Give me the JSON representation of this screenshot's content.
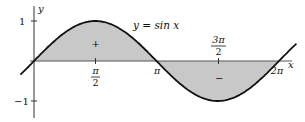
{
  "chart_data": {
    "type": "area",
    "title": "y = sin x",
    "function": "sin",
    "xlabel": "x",
    "ylabel": "y",
    "x_range": [
      -0.08,
      2.12
    ],
    "y_range": [
      -1.25,
      1.25
    ],
    "x_ticks": [
      {
        "value": 1.5708,
        "label_num": "π",
        "label_den": "2"
      },
      {
        "value": 3.1416,
        "label": "π"
      },
      {
        "value": 4.7124,
        "label_num": "3π",
        "label_den": "2"
      },
      {
        "value": 6.2832,
        "label": "2π"
      }
    ],
    "y_ticks": [
      {
        "value": 1,
        "label": "1"
      },
      {
        "value": -1,
        "label": "−1"
      }
    ],
    "regions": [
      {
        "from": 0,
        "to": 3.1416,
        "sign": "+",
        "label": "+"
      },
      {
        "from": 3.1416,
        "to": 6.2832,
        "sign": "-",
        "label": "−"
      }
    ],
    "fill_color": "#c8c8c8",
    "curve_color": "#111111"
  },
  "labels": {
    "equation": "y = sin x",
    "y_axis": "y",
    "x_axis": "x",
    "one": "1",
    "minus_one": "−1",
    "pi_over_2_num": "π",
    "pi_over_2_den": "2",
    "pi": "π",
    "three_pi_over_2_num": "3π",
    "three_pi_over_2_den": "2",
    "two_pi": "2π",
    "plus": "+",
    "minus": "−"
  }
}
